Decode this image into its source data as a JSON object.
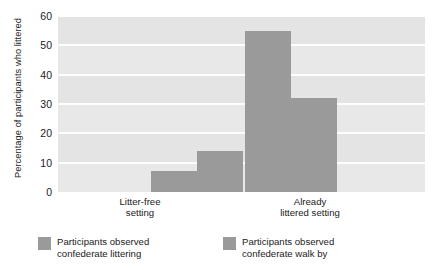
{
  "chart_data": {
    "type": "bar",
    "title": "",
    "xlabel": "",
    "ylabel": "Percentage of participants who littered",
    "ylim": [
      0,
      60
    ],
    "yticks": [
      0,
      10,
      20,
      30,
      40,
      50,
      60
    ],
    "ytick_labels": [
      "0",
      "10",
      "20",
      "30",
      "40",
      "50",
      "60"
    ],
    "grid": true,
    "legend_position": "bottom",
    "categories": [
      "Litter-free setting",
      "Already littered setting"
    ],
    "category_lines": [
      [
        "Litter-free",
        "setting"
      ],
      [
        "Already",
        "littered setting"
      ]
    ],
    "series": [
      {
        "name": "Participants observed confederate littering",
        "name_lines": [
          "Participants observed",
          "confederate littering"
        ],
        "color": "#9a9a9a",
        "values": [
          7,
          55
        ]
      },
      {
        "name": "Participants observed confederate walk by",
        "name_lines": [
          "Participants observed",
          "confederate walk by"
        ],
        "color": "#9a9a9a",
        "values": [
          14,
          32
        ]
      }
    ]
  },
  "style": {
    "plot_background": "#e8e8e8",
    "gridline_color": "#fdfdfd",
    "bar_color": "#9a9a9a",
    "text_color": "#1b1b1b"
  }
}
